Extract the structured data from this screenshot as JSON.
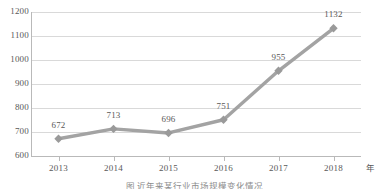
{
  "chart_data": {
    "type": "line",
    "title": "",
    "xlabel": "年",
    "ylabel": "",
    "categories": [
      "2013",
      "2014",
      "2015",
      "2016",
      "2017",
      "2018"
    ],
    "values": [
      672,
      713,
      696,
      751,
      955,
      1132
    ],
    "point_labels": [
      "672",
      "713",
      "696",
      "751",
      "955",
      "1132"
    ],
    "ylim": [
      600,
      1200
    ],
    "yticks": [
      "600",
      "700",
      "800",
      "900",
      "1000",
      "1100",
      "1200"
    ],
    "ytick_values": [
      600,
      700,
      800,
      900,
      1000,
      1100,
      1200
    ],
    "grid": true,
    "legend": "none",
    "series": [
      {
        "name": "",
        "values": [
          672,
          713,
          696,
          751,
          955,
          1132
        ],
        "line_color": "#a3a3a3",
        "marker": "diamond",
        "marker_color": "#9a9a9a"
      }
    ],
    "caption": "图 近年来某行业市场规模变化情况"
  },
  "style": {
    "grid_color": "#d9d9d9",
    "axis_color": "#b9b9b9",
    "text_color": "#595959",
    "background": "#ffffff"
  }
}
